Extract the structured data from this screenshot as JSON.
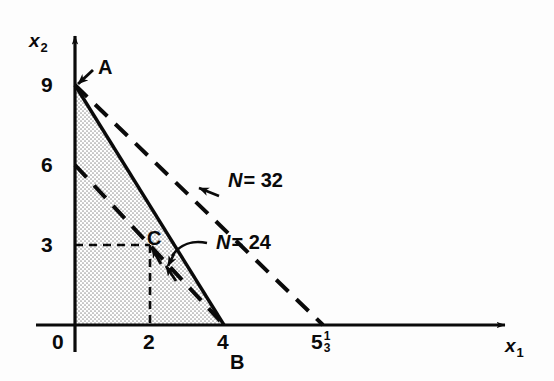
{
  "figure": {
    "type": "linear-programming-feasible-region",
    "background_color": "#fdfdfd",
    "ink_color": "#0a0a0a",
    "shade_color": "#d8d8d8"
  },
  "axes": {
    "x_axis_label": "x",
    "x_axis_subscript": "1",
    "y_axis_label": "x",
    "y_axis_subscript": "2",
    "origin_label": "0",
    "x_ticks": [
      {
        "label": "2",
        "value": 2
      },
      {
        "label": "4",
        "value": 4
      }
    ],
    "x_tick_fraction": {
      "whole": "5",
      "numerator": "1",
      "denominator": "3",
      "value": 5.3333
    },
    "y_ticks": [
      {
        "label": "3",
        "value": 3
      },
      {
        "label": "6",
        "value": 6
      },
      {
        "label": "9",
        "value": 9
      }
    ],
    "x_range": [
      0,
      7.5
    ],
    "y_range": [
      0,
      10.5
    ]
  },
  "vertices": [
    {
      "name": "A",
      "label": "A",
      "x": 0,
      "y": 9
    },
    {
      "name": "B",
      "label": "B",
      "x": 4,
      "y": 0
    },
    {
      "name": "C",
      "label": "C",
      "x": 2,
      "y": 3
    }
  ],
  "objective_lines": [
    {
      "id": "n24",
      "label_var": "N",
      "label_eq": "= 24",
      "value": 24,
      "from": {
        "x": 0,
        "y": 6
      },
      "to": {
        "x": 4,
        "y": 0
      },
      "style": "dashed"
    },
    {
      "id": "n32",
      "label_var": "N",
      "label_eq": "= 32",
      "value": 32,
      "from": {
        "x": 0,
        "y": 9
      },
      "to": {
        "x": 5.3333,
        "y": 0
      },
      "style": "dashed"
    }
  ],
  "constraint_line": {
    "id": "constraint-ab",
    "from": {
      "x": 0,
      "y": 9
    },
    "to": {
      "x": 4,
      "y": 0
    },
    "style": "solid"
  },
  "feasible_region": {
    "id": "feasible-region",
    "fill": "stipple",
    "points": [
      {
        "x": 0,
        "y": 0
      },
      {
        "x": 0,
        "y": 9
      },
      {
        "x": 4,
        "y": 0
      }
    ]
  },
  "guide_lines": [
    {
      "id": "c-horizontal",
      "from": {
        "x": 0,
        "y": 3
      },
      "to": {
        "x": 2,
        "y": 3
      },
      "style": "dashed"
    },
    {
      "id": "c-vertical",
      "from": {
        "x": 2,
        "y": 3
      },
      "to": {
        "x": 2,
        "y": 0
      },
      "style": "dashed"
    }
  ]
}
